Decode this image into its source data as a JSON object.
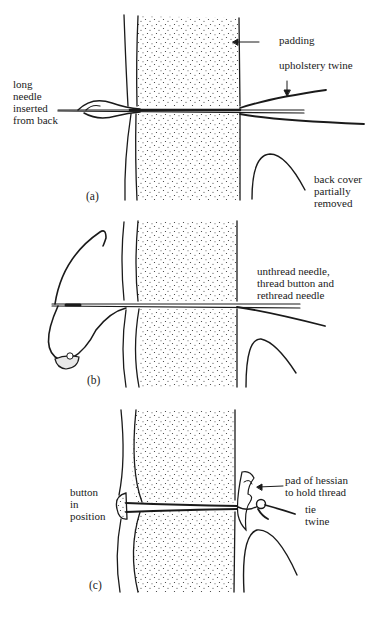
{
  "figure": {
    "panels": [
      {
        "id": "a",
        "tag": "(a)",
        "labels": {
          "padding": "padding",
          "twine": "upholstery twine",
          "needle": "long\nneedle\ninserted\nfrom back",
          "back_cover": "back cover\npartially\nremoved"
        }
      },
      {
        "id": "b",
        "tag": "(b)",
        "labels": {
          "instruction": "unthread needle,\nthread button and\nrethread needle"
        }
      },
      {
        "id": "c",
        "tag": "(c)",
        "labels": {
          "button": "button\nin\nposition",
          "hessian": "pad of hessian\nto hold thread",
          "tie": "tie\ntwine"
        }
      }
    ],
    "colors": {
      "ink": "#1a1a1a",
      "background": "#ffffff"
    }
  }
}
